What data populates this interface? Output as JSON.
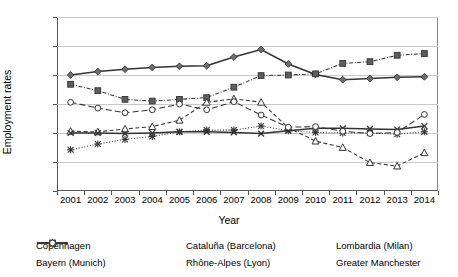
{
  "chart_data": {
    "type": "line",
    "title": "",
    "xlabel": "Year",
    "ylabel": "Employment rates",
    "categories": [
      2001,
      2002,
      2003,
      2004,
      2005,
      2006,
      2007,
      2008,
      2009,
      2010,
      2011,
      2012,
      2013,
      2014
    ],
    "ylim": [
      55,
      85
    ],
    "yticks": [
      55,
      60,
      65,
      70,
      75,
      80,
      85
    ],
    "grid": true,
    "legend_position": "bottom",
    "series": [
      {
        "name": "Copenhagen",
        "marker": "diamond",
        "dash": "solid",
        "values": [
          75.0,
          75.6,
          76.0,
          76.3,
          76.5,
          76.6,
          78.1,
          79.4,
          76.9,
          75.1,
          74.2,
          74.4,
          74.6,
          74.7
        ]
      },
      {
        "name": "Bayern (Munich)",
        "marker": "square",
        "dash": "dashdot",
        "values": [
          73.4,
          72.3,
          70.8,
          70.5,
          70.8,
          71.1,
          72.9,
          74.9,
          75.0,
          75.2,
          77.0,
          77.3,
          78.4,
          78.7
        ]
      },
      {
        "name": "Cataluña (Barcelona)",
        "marker": "triangle",
        "dash": "dashed",
        "values": [
          65.3,
          65.2,
          65.7,
          66.1,
          67.2,
          70.3,
          70.9,
          70.3,
          65.9,
          63.6,
          62.5,
          59.9,
          59.3,
          61.6
        ]
      },
      {
        "name": "Rhône-Alpes (Lyon)",
        "marker": "cross",
        "dash": "solid",
        "values": [
          65.0,
          65.0,
          64.9,
          65.0,
          65.2,
          65.2,
          65.1,
          64.9,
          65.4,
          65.8,
          65.8,
          65.7,
          65.6,
          66.2
        ]
      },
      {
        "name": "Lombardia (Milan)",
        "marker": "star",
        "dash": "dotted",
        "values": [
          62.1,
          63.1,
          63.9,
          64.4,
          65.2,
          65.5,
          65.5,
          66.2,
          65.4,
          65.1,
          65.0,
          65.0,
          64.8,
          65.2
        ]
      },
      {
        "name": "Greater Manchester",
        "marker": "circle",
        "dash": "longdash",
        "values": [
          70.3,
          69.3,
          68.5,
          69.0,
          70.0,
          69.0,
          70.4,
          68.1,
          66.0,
          66.1,
          65.3,
          64.9,
          65.1,
          68.2
        ]
      }
    ]
  },
  "legend": [
    {
      "label": "Copenhagen"
    },
    {
      "label": "Cataluña (Barcelona)"
    },
    {
      "label": "Lombardia (Milan)"
    },
    {
      "label": "Bayern (Munich)"
    },
    {
      "label": "Rhône-Alpes (Lyon)"
    },
    {
      "label": "Greater Manchester"
    }
  ],
  "colors": {
    "ink": "#333333",
    "grid": "#c9c9c9",
    "axis": "#555555"
  }
}
